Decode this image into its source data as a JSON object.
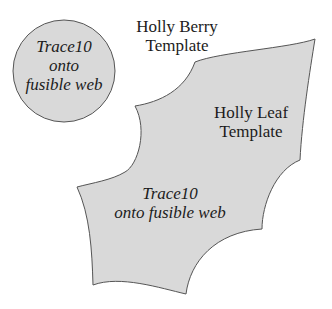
{
  "berry": {
    "title_line1": "Holly Berry",
    "title_line2": "Template",
    "instr_line1": "Trace10",
    "instr_line2": "onto",
    "instr_line3": "fusible web"
  },
  "leaf": {
    "title_line1": "Holly Leaf",
    "title_line2": "Template",
    "instr_line1": "Trace10",
    "instr_line2": "onto fusible web"
  },
  "colors": {
    "fill": "#d9d9d9",
    "stroke": "#555555",
    "background": "#ffffff"
  }
}
